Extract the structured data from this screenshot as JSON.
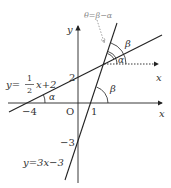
{
  "diagram": {
    "axes": {
      "x_label": "x",
      "y_label": "y",
      "origin_label": "O"
    },
    "ticks": {
      "x_neg4": "−4",
      "x_1": "1",
      "y_2": "2",
      "y_neg3": "−3"
    },
    "lines": [
      {
        "name": "line-a",
        "equation_prefix": "y=",
        "frac_num": "1",
        "frac_den": "2",
        "equation_suffix": "x+2",
        "slope": 0.5,
        "intercept": 2
      },
      {
        "name": "line-b",
        "equation": "y=3x−3",
        "slope": 3,
        "intercept": -3
      }
    ],
    "angles": {
      "alpha": "α",
      "beta": "β"
    },
    "annotation": "θ=β−α",
    "aux_axis_label": "x",
    "colors": {
      "line": "#222222",
      "text": "#333333",
      "annotation": "#888888"
    }
  }
}
